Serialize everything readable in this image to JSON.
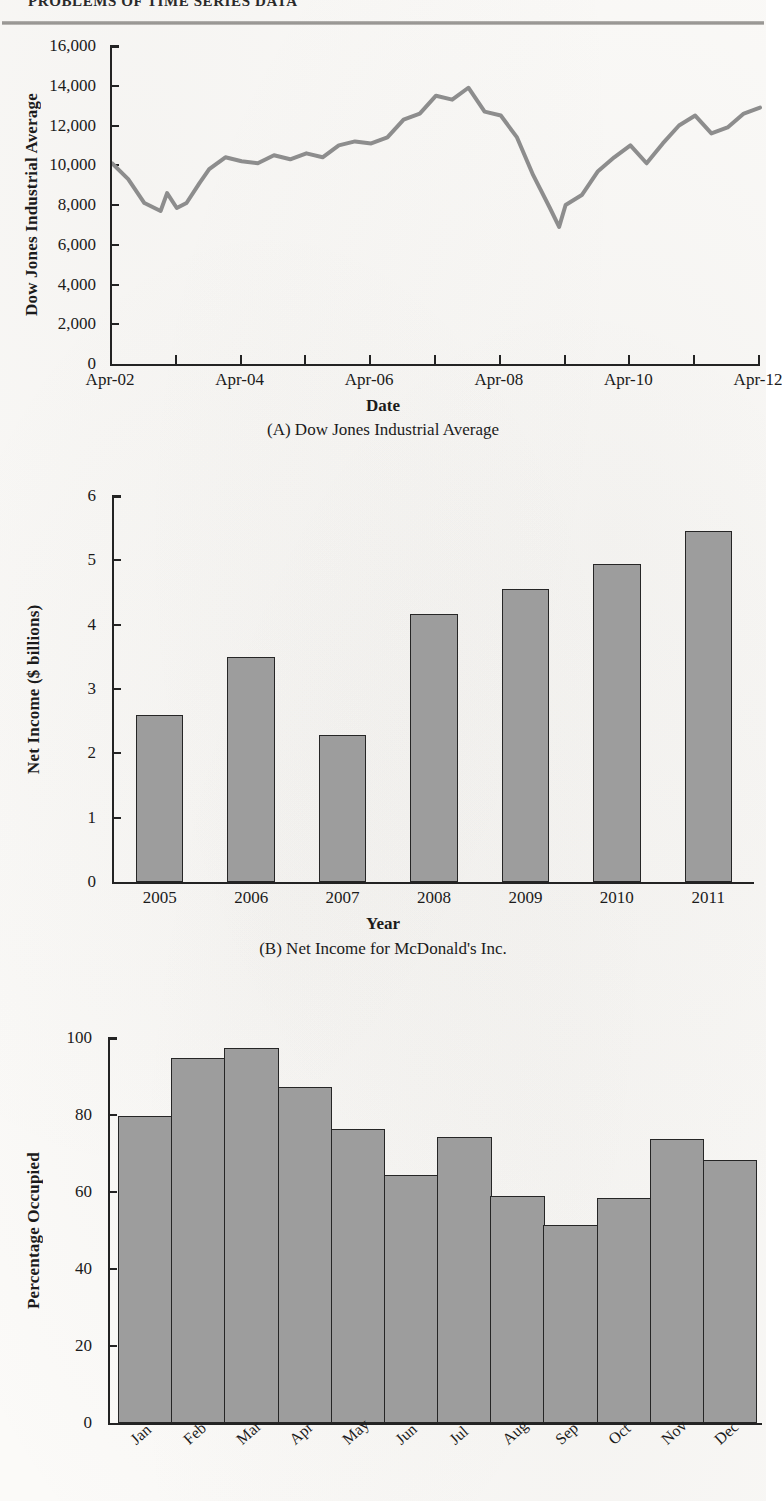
{
  "header": {
    "running_head": "PROBLEMS OF TIME SERIES DATA"
  },
  "chart_data": [
    {
      "id": "A",
      "type": "line",
      "title": "(A) Dow Jones Industrial Average",
      "xlabel": "Date",
      "ylabel": "Dow Jones Industrial Average",
      "ylim": [
        0,
        16000
      ],
      "yticks": [
        0,
        2000,
        4000,
        6000,
        8000,
        10000,
        12000,
        14000,
        16000
      ],
      "ytick_labels": [
        "0",
        "2,000",
        "4,000",
        "6,000",
        "8,000",
        "10,000",
        "12,000",
        "14,000",
        "16,000"
      ],
      "xtick_labels": [
        "Apr-02",
        "Apr-04",
        "Apr-06",
        "Apr-08",
        "Apr-10",
        "Apr-12"
      ],
      "xlim": [
        2002.25,
        2012.25
      ],
      "minor_ticks_per_major": 2,
      "grid": false,
      "legend": "none",
      "line_color": "#8d8d8d",
      "x": [
        2002.25,
        2002.5,
        2002.75,
        2003.0,
        2003.1,
        2003.25,
        2003.4,
        2003.6,
        2003.75,
        2004.0,
        2004.25,
        2004.5,
        2004.75,
        2005.0,
        2005.25,
        2005.5,
        2005.75,
        2006.0,
        2006.25,
        2006.5,
        2006.75,
        2007.0,
        2007.25,
        2007.5,
        2007.75,
        2008.0,
        2008.25,
        2008.5,
        2008.75,
        2009.0,
        2009.15,
        2009.25,
        2009.5,
        2009.75,
        2010.0,
        2010.25,
        2010.5,
        2010.75,
        2011.0,
        2011.25,
        2011.5,
        2011.75,
        2012.0,
        2012.25
      ],
      "values": [
        10100,
        9300,
        8100,
        7700,
        8600,
        7850,
        8100,
        9100,
        9800,
        10400,
        10200,
        10100,
        10500,
        10300,
        10600,
        10400,
        11000,
        11200,
        11100,
        11400,
        12300,
        12600,
        13500,
        13300,
        13900,
        12700,
        12500,
        11400,
        9500,
        7900,
        6900,
        8000,
        8500,
        9700,
        10400,
        11000,
        10100,
        11100,
        12000,
        12500,
        11600,
        11900,
        12600,
        12900
      ],
      "annotations": [
        "peak ~13,900 in late 2007",
        "trough ~6,900 in early 2009"
      ]
    },
    {
      "id": "B",
      "type": "bar",
      "title": "(B) Net Income for McDonald's Inc.",
      "xlabel": "Year",
      "ylabel": "Net Income ($ billions)",
      "ylim": [
        0,
        6
      ],
      "yticks": [
        0,
        1,
        2,
        3,
        4,
        5,
        6
      ],
      "ytick_labels": [
        "0",
        "1",
        "2",
        "3",
        "4",
        "5",
        "6"
      ],
      "categories": [
        "2005",
        "2006",
        "2007",
        "2008",
        "2009",
        "2010",
        "2011"
      ],
      "values": [
        2.6,
        3.49,
        2.28,
        4.17,
        4.55,
        4.95,
        5.45
      ],
      "grid": false,
      "legend": "none",
      "bar_color": "#9d9d9d",
      "bar_edge_color": "#262626"
    },
    {
      "id": "C",
      "type": "bar",
      "title": "",
      "xlabel": "",
      "ylabel": "Percentage Occupied",
      "ylim": [
        0,
        100
      ],
      "yticks": [
        0,
        20,
        40,
        60,
        80,
        100
      ],
      "ytick_labels": [
        "0",
        "20",
        "40",
        "60",
        "80",
        "100"
      ],
      "categories": [
        "Jan",
        "Feb",
        "Mar",
        "Apr",
        "May",
        "Jun",
        "Jul",
        "Aug",
        "Sep",
        "Oct",
        "Nov",
        "Dec"
      ],
      "values": [
        79.8,
        94.8,
        97.4,
        87.4,
        76.4,
        64.4,
        74.4,
        59.0,
        51.4,
        58.4,
        73.7,
        68.4
      ],
      "grid": false,
      "legend": "none",
      "bar_color": "#9d9d9d",
      "bar_edge_color": "#262626",
      "style": "histogram-contiguous"
    }
  ]
}
